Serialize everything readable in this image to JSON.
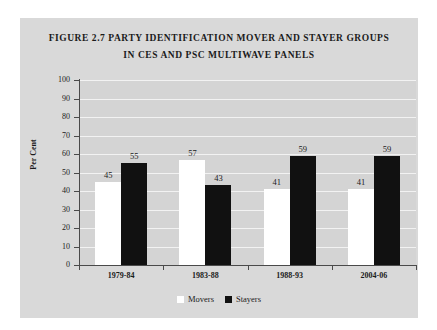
{
  "figure": {
    "title_line1": "FIGURE 2.7 PARTY IDENTIFICATION MOVER AND STAYER GROUPS",
    "title_line2": "IN CES AND PSC MULTIWAVE PANELS",
    "panel_background": "#d9d9d9",
    "plot_background": "#d4d4d4",
    "gridline_color": "#f2f2f2",
    "axis_color": "#4a4a4a"
  },
  "chart_data": {
    "type": "bar",
    "title": "FIGURE 2.7 PARTY IDENTIFICATION MOVER AND STAYER GROUPS IN CES AND PSC MULTIWAVE PANELS",
    "xlabel": "",
    "ylabel": "Per Cent",
    "ylim": [
      0,
      100
    ],
    "ytick_step": 10,
    "yticks": [
      0,
      10,
      20,
      30,
      40,
      50,
      60,
      70,
      80,
      90,
      100
    ],
    "ytick_labels": [
      "0",
      "10",
      "20",
      "30",
      "40",
      "50",
      "60",
      "70",
      "80",
      "90",
      "100"
    ],
    "categories": [
      "1979-84",
      "1983-88",
      "1988-93",
      "2004-06"
    ],
    "grid": true,
    "grid_axis": "y",
    "legend_position": "bottom",
    "series": [
      {
        "name": "Movers",
        "color": "#ffffff",
        "values": [
          45,
          57,
          41,
          41
        ],
        "labels": [
          "45",
          "57",
          "41",
          "41"
        ]
      },
      {
        "name": "Stayers",
        "color": "#111111",
        "values": [
          55,
          43,
          59,
          59
        ],
        "labels": [
          "55",
          "43",
          "59",
          "59"
        ]
      }
    ]
  },
  "legend": {
    "items": [
      {
        "label": "Movers",
        "swatch": "movers-swatch"
      },
      {
        "label": "Stayers",
        "swatch": "stayers-swatch"
      }
    ]
  }
}
